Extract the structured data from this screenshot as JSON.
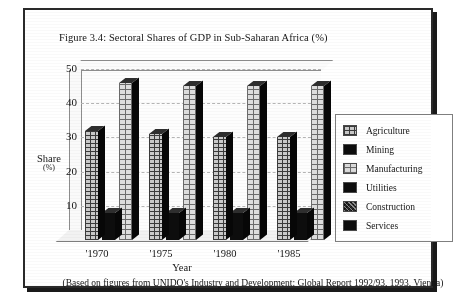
{
  "figure": {
    "title": "Figure 3.4: Sectoral Shares of GDP in Sub-Saharan Africa (%)",
    "source_note": "(Based on figures from UNIDO's Industry and Development: Global Report 1992/93, 1993, Vienna)"
  },
  "axes": {
    "y_title": "Share",
    "y_unit": "(%)",
    "x_title": "Year"
  },
  "chart_data": {
    "type": "bar",
    "title": "Figure 3.4: Sectoral Shares of GDP in Sub-Saharan Africa (%)",
    "xlabel": "Year",
    "ylabel": "Share (%)",
    "ylim": [
      0,
      50
    ],
    "yticks": [
      10,
      20,
      30,
      40,
      50
    ],
    "ytick_labels": [
      "10",
      "20",
      "30",
      "40",
      "50"
    ],
    "grid": true,
    "legend_position": "right",
    "projection": "3d-bar",
    "categories": [
      "'1970",
      "'1975",
      "'1980",
      "'1985"
    ],
    "series": [
      {
        "name": "Agriculture",
        "swatch": "grid",
        "values": [
          32,
          31,
          30,
          30
        ]
      },
      {
        "name": "Mining",
        "swatch": "solid",
        "values": [
          8,
          8,
          8,
          8
        ]
      },
      {
        "name": "Manufacturing",
        "swatch": "grid-light",
        "values": [
          46,
          45,
          45,
          45
        ]
      },
      {
        "name": "Utilities",
        "swatch": "solid",
        "values": [
          32,
          31,
          30,
          30
        ]
      },
      {
        "name": "Construction",
        "swatch": "speckle",
        "values": [
          8,
          8,
          8,
          8
        ]
      },
      {
        "name": "Services",
        "swatch": "solid",
        "values": [
          46,
          45,
          45,
          45
        ]
      }
    ]
  },
  "legend": {
    "items": [
      {
        "label": "Agriculture",
        "swatch": "grid"
      },
      {
        "label": "Mining",
        "swatch": "solid"
      },
      {
        "label": "Manufacturing",
        "swatch": "grid-light"
      },
      {
        "label": "Utilities",
        "swatch": "solid"
      },
      {
        "label": "Construction",
        "swatch": "speckle"
      },
      {
        "label": "Services",
        "swatch": "solid"
      }
    ]
  }
}
